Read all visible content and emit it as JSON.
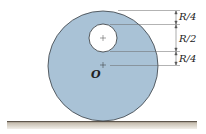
{
  "diagram": {
    "colors": {
      "disk_fill": "#a9c2d6",
      "disk_stroke": "#3a3f44",
      "hole_fill": "#ffffff",
      "ground_fill": "#b9b0a2",
      "ground_line": "#6b6257",
      "dim_line": "#555555"
    },
    "labels": {
      "center": "O",
      "dim_top": "R/4",
      "dim_middle": "R/2",
      "dim_bottom": "R/4"
    }
  }
}
